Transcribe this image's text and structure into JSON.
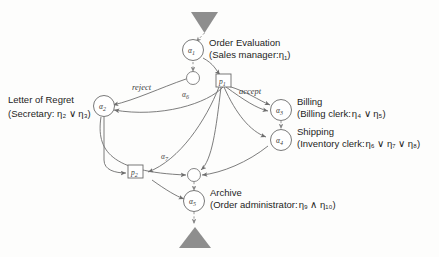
{
  "diagram": {
    "terminals": [
      {
        "name": "start-terminal",
        "shape": "triangle-down"
      },
      {
        "name": "end-terminal",
        "shape": "triangle-up"
      }
    ],
    "tasks": [
      {
        "id": "alpha1",
        "node_label": "α",
        "node_sub": "1",
        "name": "Order Evaluation",
        "role": "(Sales manager:",
        "role_eta": "η",
        "role_eta_sub": "1",
        "role_close": ")"
      },
      {
        "id": "alpha2",
        "node_label": "α",
        "node_sub": "2",
        "name": "Letter of Regret",
        "role": "(Secretary: ",
        "role_expr": "η₂ ∨ η₃)"
      },
      {
        "id": "alpha3",
        "node_label": "α",
        "node_sub": "3",
        "name": "Billing",
        "role": "(Billing clerk:",
        "role_expr": "η₄ ∨ η₅)"
      },
      {
        "id": "alpha4",
        "node_label": "α",
        "node_sub": "4",
        "name": "Shipping",
        "role": "(Inventory clerk:",
        "role_expr": "η₆ ∨ η₇ ∨ η₈)"
      },
      {
        "id": "alpha5",
        "node_label": "α",
        "node_sub": "5",
        "name": "Archive",
        "role": "(Order administrator:",
        "role_expr": "η₉ ∧ η₁₀)"
      }
    ],
    "places": [
      {
        "id": "p1",
        "label": "p",
        "sub": "1",
        "shape": "box"
      },
      {
        "id": "p2",
        "label": "p",
        "sub": "2",
        "shape": "box"
      },
      {
        "id": "alpha6",
        "label": "α",
        "sub": "6",
        "shape": "circle"
      },
      {
        "id": "alpha7",
        "label": "α",
        "sub": "7",
        "shape": "circle"
      }
    ],
    "edge_labels": [
      {
        "id": "reject",
        "text": "reject"
      },
      {
        "id": "accept",
        "text": "accept"
      }
    ],
    "colors": {
      "stroke": "#6e6e6e",
      "terminal_fill": "#8e8e8e",
      "text": "#1d1d1d",
      "background": "#fdfdfc"
    }
  }
}
